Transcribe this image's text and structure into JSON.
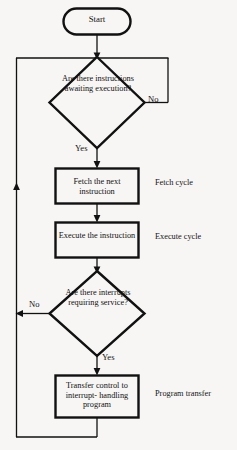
{
  "diagram": {
    "type": "flowchart",
    "background_color": "#f7f6f4",
    "stroke_color": "#111111",
    "nodes": {
      "start": {
        "shape": "terminator",
        "label": "Start"
      },
      "decision_instructions": {
        "shape": "diamond",
        "label": "Are\nthere\ninstructions\nawaiting\nexecution?"
      },
      "fetch": {
        "shape": "process",
        "label": "Fetch the next\ninstruction"
      },
      "execute": {
        "shape": "process",
        "label": "Execute the\ninstruction"
      },
      "decision_interrupts": {
        "shape": "diamond",
        "label": "Are\nthere\ninterrupts\nrequiring\nservice?"
      },
      "transfer": {
        "shape": "process",
        "label": "Transfer control\nto interrupt-\nhandling program"
      }
    },
    "edge_labels": {
      "no_1": "No",
      "yes_1": "Yes",
      "no_2": "No",
      "yes_2": "Yes"
    },
    "annotations": {
      "fetch_cycle": "Fetch cycle",
      "execute_cycle": "Execute cycle",
      "program_transfer": "Program transfer"
    }
  }
}
